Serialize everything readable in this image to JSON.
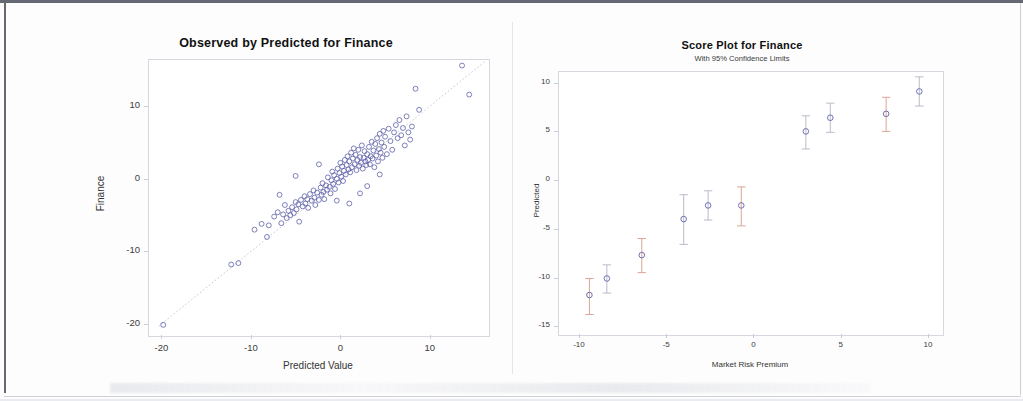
{
  "document": {
    "kind": "scanned-figure-page",
    "panel_count": 2
  },
  "left_chart": {
    "title": "Observed by Predicted for Finance",
    "xlabel": "Predicted Value",
    "ylabel": "Finance",
    "xticks": [
      "-20",
      "-10",
      "0",
      "10"
    ],
    "yticks": [
      "10",
      "0",
      "-10",
      "-20"
    ],
    "marker_color": "#5b5ea8",
    "refline_label": "identity line"
  },
  "right_chart": {
    "title": "Score Plot for Finance",
    "subtitle": "With 95% Confidence Limits",
    "xlabel": "Market Risk Premium",
    "ylabel": "Predicted",
    "xticks": [
      "-10",
      "-5",
      "0",
      "5",
      "10"
    ],
    "yticks": [
      "10",
      "5",
      "0",
      "-5",
      "-10",
      "-15"
    ],
    "marker_color": "#6f72b4",
    "errorbar_color_a": "#d9a18e",
    "errorbar_color_b": "#b6b8c6"
  },
  "chart_data": [
    {
      "type": "scatter",
      "title": "Observed by Predicted for Finance",
      "xlabel": "Predicted Value",
      "ylabel": "Finance",
      "xlim": [
        -21.5,
        16.5
      ],
      "ylim": [
        -21.5,
        16.5
      ],
      "xticks": [
        -20,
        -10,
        0,
        10
      ],
      "yticks": [
        10,
        0,
        -10,
        -20
      ],
      "grid": false,
      "legend": "none",
      "reference_line": {
        "type": "identity",
        "slope": 1,
        "intercept": 0,
        "style": "dotted"
      },
      "points": [
        [
          -19.8,
          -20.1
        ],
        [
          -12.2,
          -11.8
        ],
        [
          -11.4,
          -11.6
        ],
        [
          -9.6,
          -7.0
        ],
        [
          -8.8,
          -6.2
        ],
        [
          -8.2,
          -8.0
        ],
        [
          -8.0,
          -6.4
        ],
        [
          -7.4,
          -5.2
        ],
        [
          -7.0,
          -4.6
        ],
        [
          -6.6,
          -6.1
        ],
        [
          -6.4,
          -4.9
        ],
        [
          -6.2,
          -3.6
        ],
        [
          -6.0,
          -5.4
        ],
        [
          -5.8,
          -4.4
        ],
        [
          -5.6,
          -5.0
        ],
        [
          -5.4,
          -3.9
        ],
        [
          -5.2,
          -4.7
        ],
        [
          -5.0,
          -3.2
        ],
        [
          -4.9,
          -4.2
        ],
        [
          -4.7,
          -3.5
        ],
        [
          -4.6,
          -5.9
        ],
        [
          -4.4,
          -2.9
        ],
        [
          -4.2,
          -3.8
        ],
        [
          -4.0,
          -2.4
        ],
        [
          -3.9,
          -3.4
        ],
        [
          -3.7,
          -2.8
        ],
        [
          -3.6,
          -4.0
        ],
        [
          -3.4,
          -2.1
        ],
        [
          -3.2,
          -3.0
        ],
        [
          -3.0,
          -1.6
        ],
        [
          -2.9,
          -2.6
        ],
        [
          -2.8,
          -3.6
        ],
        [
          -2.6,
          -1.9
        ],
        [
          -2.4,
          -2.9
        ],
        [
          -2.2,
          -1.2
        ],
        [
          -2.1,
          -2.2
        ],
        [
          -2.0,
          -0.6
        ],
        [
          -1.9,
          -1.8
        ],
        [
          -1.8,
          -2.8
        ],
        [
          -1.6,
          -0.9
        ],
        [
          -1.5,
          -1.5
        ],
        [
          -1.4,
          0.2
        ],
        [
          -1.2,
          -1.1
        ],
        [
          -1.1,
          -2.0
        ],
        [
          -1.0,
          -0.2
        ],
        [
          -0.9,
          1.0
        ],
        [
          -0.8,
          -0.7
        ],
        [
          -0.7,
          0.5
        ],
        [
          -0.6,
          -1.4
        ],
        [
          -0.4,
          0.0
        ],
        [
          -0.3,
          1.4
        ],
        [
          -0.2,
          -0.5
        ],
        [
          -0.1,
          0.8
        ],
        [
          0.0,
          2.2
        ],
        [
          0.1,
          0.3
        ],
        [
          0.2,
          1.7
        ],
        [
          0.3,
          -0.3
        ],
        [
          0.4,
          1.1
        ],
        [
          0.5,
          2.6
        ],
        [
          0.6,
          0.6
        ],
        [
          0.7,
          1.9
        ],
        [
          0.8,
          3.1
        ],
        [
          0.9,
          1.3
        ],
        [
          1.0,
          2.4
        ],
        [
          1.1,
          0.9
        ],
        [
          1.2,
          3.6
        ],
        [
          1.3,
          1.6
        ],
        [
          1.4,
          2.8
        ],
        [
          1.5,
          4.2
        ],
        [
          1.6,
          2.0
        ],
        [
          1.7,
          3.3
        ],
        [
          1.8,
          1.2
        ],
        [
          1.9,
          2.6
        ],
        [
          2.0,
          4.0
        ],
        [
          2.1,
          1.8
        ],
        [
          2.2,
          3.0
        ],
        [
          2.3,
          2.2
        ],
        [
          2.4,
          4.6
        ],
        [
          2.5,
          1.4
        ],
        [
          2.6,
          2.9
        ],
        [
          2.7,
          3.8
        ],
        [
          2.8,
          2.4
        ],
        [
          2.9,
          1.9
        ],
        [
          3.0,
          3.4
        ],
        [
          3.1,
          2.6
        ],
        [
          3.2,
          4.4
        ],
        [
          3.3,
          2.0
        ],
        [
          3.4,
          3.1
        ],
        [
          3.5,
          5.1
        ],
        [
          3.6,
          2.8
        ],
        [
          3.7,
          3.9
        ],
        [
          3.8,
          1.6
        ],
        [
          3.9,
          4.8
        ],
        [
          4.0,
          3.2
        ],
        [
          4.1,
          5.6
        ],
        [
          4.2,
          2.4
        ],
        [
          4.3,
          4.1
        ],
        [
          4.4,
          6.2
        ],
        [
          4.5,
          3.6
        ],
        [
          4.6,
          5.0
        ],
        [
          4.7,
          2.9
        ],
        [
          4.8,
          6.6
        ],
        [
          4.9,
          4.4
        ],
        [
          5.0,
          5.8
        ],
        [
          5.2,
          3.4
        ],
        [
          5.4,
          6.9
        ],
        [
          5.6,
          5.2
        ],
        [
          5.8,
          4.0
        ],
        [
          6.0,
          6.4
        ],
        [
          6.2,
          7.4
        ],
        [
          6.4,
          5.6
        ],
        [
          6.6,
          8.1
        ],
        [
          6.8,
          6.0
        ],
        [
          7.0,
          7.0
        ],
        [
          7.2,
          4.6
        ],
        [
          7.4,
          8.6
        ],
        [
          7.6,
          6.4
        ],
        [
          7.8,
          5.4
        ],
        [
          8.0,
          7.2
        ],
        [
          8.4,
          12.4
        ],
        [
          8.8,
          9.5
        ],
        [
          4.4,
          0.6
        ],
        [
          3.0,
          -1.0
        ],
        [
          2.2,
          -2.0
        ],
        [
          1.0,
          -3.4
        ],
        [
          -0.4,
          -3.0
        ],
        [
          -2.4,
          2.0
        ],
        [
          -5.0,
          0.4
        ],
        [
          -6.8,
          -2.2
        ],
        [
          13.6,
          15.6
        ],
        [
          14.4,
          11.6
        ]
      ]
    },
    {
      "type": "scatter",
      "title": "Score Plot for Finance",
      "subtitle": "With 95% Confidence Limits",
      "xlabel": "Market Risk Premium",
      "ylabel": "Predicted",
      "xlim": [
        -11.2,
        10.8
      ],
      "ylim": [
        -15.8,
        11.2
      ],
      "xticks": [
        -10,
        -5,
        0,
        5,
        10
      ],
      "yticks": [
        10,
        5,
        0,
        -5,
        -10,
        -15
      ],
      "grid": false,
      "legend": "none",
      "series": [
        {
          "name": "Predicted with 95% CI",
          "x": [
            -9.4,
            -8.4,
            -6.4,
            -4.0,
            -2.6,
            -0.7,
            3.0,
            4.4,
            7.6,
            9.5
          ],
          "y": [
            -11.8,
            -10.1,
            -7.7,
            -4.0,
            -2.6,
            -2.6,
            5.0,
            6.4,
            6.8,
            9.1
          ],
          "ci_lo": [
            -13.8,
            -11.6,
            -9.5,
            -6.6,
            -4.1,
            -4.7,
            3.2,
            4.9,
            5.0,
            7.6
          ],
          "ci_hi": [
            -10.1,
            -8.7,
            -6.0,
            -1.5,
            -1.1,
            -0.7,
            6.6,
            7.9,
            8.5,
            10.6
          ]
        }
      ]
    }
  ]
}
